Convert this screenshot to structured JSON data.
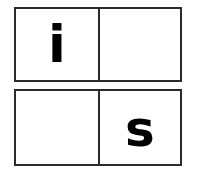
{
  "grid": {
    "columns": 2,
    "rows": 2,
    "border_color": "#2b2b2b",
    "background_color": "#ffffff",
    "text_color": "#000000",
    "rows_data": [
      {
        "row_label": "row-top",
        "cells": [
          {
            "position": "top-left",
            "letter": "i",
            "empty": false
          },
          {
            "position": "top-right",
            "letter": "",
            "empty": true
          }
        ]
      },
      {
        "row_label": "row-bottom",
        "cells": [
          {
            "position": "bottom-left",
            "letter": "",
            "empty": true
          },
          {
            "position": "bottom-right",
            "letter": "s",
            "empty": false
          }
        ]
      }
    ]
  }
}
